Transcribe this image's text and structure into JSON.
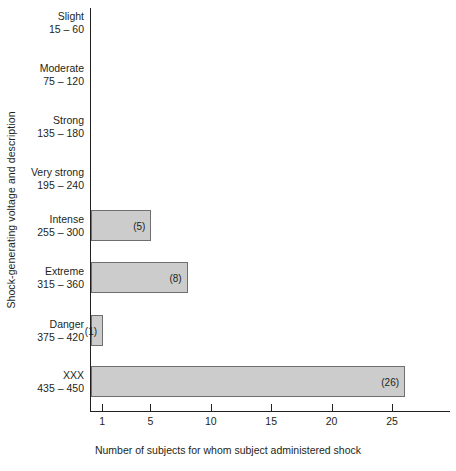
{
  "chart_data": {
    "type": "bar",
    "orientation": "horizontal",
    "title": "",
    "xlabel": "Number of subjects for whom subject administered shock",
    "ylabel": "Shock-generating voltage and description",
    "categories": [
      {
        "name": "Slight",
        "range": "15 – 60"
      },
      {
        "name": "Moderate",
        "range": "75 – 120"
      },
      {
        "name": "Strong",
        "range": "135 – 180"
      },
      {
        "name": "Very strong",
        "range": "195 – 240"
      },
      {
        "name": "Intense",
        "range": "255 – 300"
      },
      {
        "name": "Extreme",
        "range": "315 – 360"
      },
      {
        "name": "Danger",
        "range": "375 – 420"
      },
      {
        "name": "XXX",
        "range": "435 – 450"
      }
    ],
    "values": [
      0,
      0,
      0,
      0,
      5,
      8,
      1,
      26
    ],
    "value_labels": [
      "",
      "",
      "",
      "",
      "(5)",
      "(8)",
      "(1)",
      "(26)"
    ],
    "xticks": [
      1,
      5,
      10,
      15,
      20,
      25
    ],
    "xtick_labels": [
      "1",
      "5",
      "10",
      "15",
      "20",
      "25"
    ],
    "xlim": [
      0,
      29.5
    ],
    "grid": false,
    "legend": null,
    "bar_fill_color": "#cccccc",
    "bar_border_color": "#6f6f6f",
    "axis_color": "#231f20",
    "text_color": "#231f20"
  }
}
